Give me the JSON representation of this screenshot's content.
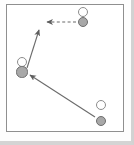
{
  "figure": {
    "type": "sports-play-diagram",
    "frame": {
      "border_color": "#8f8f8f",
      "background": "#ffffff"
    },
    "colors": {
      "offense_fill": "#ffffff",
      "offense_stroke": "#8c8c8c",
      "defense_fill": "#a8a8a8",
      "defense_stroke": "#6e6e6e",
      "arrow_solid": "#6b6b6b",
      "arrow_dashed": "#6b6b6b"
    }
  },
  "players": [
    {
      "id": "offense-top-right",
      "role": "offense",
      "label": "",
      "cx": 83,
      "cy": 12,
      "r": 5
    },
    {
      "id": "defense-top-right",
      "role": "defense",
      "label": "",
      "cx": 83,
      "cy": 22,
      "r": 5.2
    },
    {
      "id": "offense-left-middle",
      "role": "offense",
      "label": "",
      "cx": 22,
      "cy": 62,
      "r": 5
    },
    {
      "id": "defense-left-middle",
      "role": "defense",
      "label": "",
      "cx": 22,
      "cy": 72,
      "r": 5.6
    },
    {
      "id": "offense-bottom-right",
      "role": "offense",
      "label": "",
      "cx": 101,
      "cy": 105,
      "r": 5
    },
    {
      "id": "defense-bottom-right",
      "role": "defense",
      "label": "",
      "cx": 101,
      "cy": 121,
      "r": 5.4
    }
  ],
  "movements": [
    {
      "id": "pass-dashed-left",
      "style": "dashed",
      "from": {
        "x": 76,
        "y": 22
      },
      "to": {
        "x": 47,
        "y": 22
      },
      "arrowhead": "left"
    },
    {
      "id": "cut-solid-up",
      "style": "solid",
      "from": {
        "x": 27,
        "y": 68
      },
      "to": {
        "x": 39,
        "y": 30
      },
      "arrowhead": "up"
    },
    {
      "id": "drive-solid-upleft",
      "style": "solid",
      "from": {
        "x": 95,
        "y": 117
      },
      "to": {
        "x": 30,
        "y": 75
      },
      "arrowhead": "up-left"
    }
  ]
}
